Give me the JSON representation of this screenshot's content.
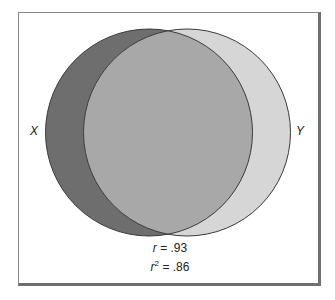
{
  "diagram": {
    "type": "venn",
    "left_set": {
      "label": "X",
      "color": "#6e6e6e"
    },
    "right_set": {
      "label": "Y",
      "color": "#d6d6d6"
    },
    "overlap_color": "#a8a8a8",
    "stats": {
      "r_label": "r",
      "r_value": "= .93",
      "r2_label": "r",
      "r2_exp": "2",
      "r2_value": "= .86"
    }
  }
}
